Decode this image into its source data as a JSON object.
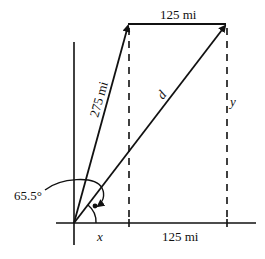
{
  "diagram": {
    "labels": {
      "top_segment": "125 mi",
      "slanted_segment": "275 mi",
      "diagonal": "d",
      "vertical_right": "y",
      "angle": "65.5°",
      "bottom_left": "x",
      "bottom_right": "125 mi"
    },
    "colors": {
      "stroke": "#111111",
      "background": "#ffffff"
    }
  }
}
